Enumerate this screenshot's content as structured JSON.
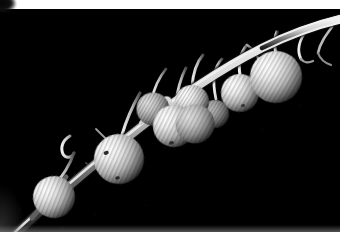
{
  "image": {
    "kind": "photograph",
    "subject": "branch with hanging berries",
    "palette": "monochrome black and white",
    "background_color": "#000000",
    "border_color": "#ffffff",
    "highlight_color": "#f2f2f2",
    "midtone_color": "#9a9a9a",
    "shadow_color": "#1a1a1a",
    "stem_color": "#d8d8d8",
    "width": 348,
    "height": 232,
    "border_top_px": 9,
    "border_right_px": 8,
    "alt_text": "High contrast black and white macro photograph of an arching branch running from the lower left to the upper right of the frame, with nine round, finely ribbed berries hanging from slender curved stalks against a pure black background.",
    "berry_count": 9,
    "stalk_count": 11
  },
  "elements": {
    "branch_label": "main branch",
    "berries_label": "hanging berries",
    "stalks_label": "berry stalks",
    "background_label": "black background",
    "border_label": "white photo border",
    "corner_mark_label": "dark corner mark"
  },
  "berries": [
    {
      "id": "berry-1",
      "cx": 54,
      "cy": 188,
      "rx": 21,
      "ry": 20,
      "rotate": -16,
      "brightness": 0.94
    },
    {
      "id": "berry-2",
      "cx": 119,
      "cy": 150,
      "rx": 25,
      "ry": 25,
      "rotate": -14,
      "brightness": 0.97
    },
    {
      "id": "berry-3",
      "cx": 174,
      "cy": 117,
      "rx": 21,
      "ry": 21,
      "rotate": -12,
      "brightness": 0.9
    },
    {
      "id": "berry-4",
      "cx": 153,
      "cy": 100,
      "rx": 16,
      "ry": 16,
      "rotate": -12,
      "brightness": 0.8
    },
    {
      "id": "berry-5",
      "cx": 192,
      "cy": 93,
      "rx": 16,
      "ry": 16,
      "rotate": -10,
      "brightness": 0.86
    },
    {
      "id": "berry-6",
      "cx": 189,
      "cy": 118,
      "rx": 20,
      "ry": 20,
      "rotate": -10,
      "brightness": 0.88
    },
    {
      "id": "berry-7",
      "cx": 240,
      "cy": 84,
      "rx": 18,
      "ry": 18,
      "rotate": -9,
      "brightness": 0.82
    },
    {
      "id": "berry-8",
      "cx": 276,
      "cy": 68,
      "rx": 26,
      "ry": 26,
      "rotate": -8,
      "brightness": 0.95
    },
    {
      "id": "berry-9",
      "cx": 215,
      "cy": 105,
      "rx": 14,
      "ry": 14,
      "rotate": -10,
      "brightness": 0.7
    }
  ],
  "stalks": [
    {
      "id": "stalk-1",
      "path": "M 48 206 C 46 214 44 222 42 231"
    },
    {
      "id": "stalk-2",
      "path": "M 70 136 C 66 150 60 166 50 172"
    },
    {
      "id": "stalk-3",
      "path": "M 96 122 C 104 132 114 130 119 127"
    },
    {
      "id": "stalk-4",
      "path": "M 126 112 C 120 126 114 136 108 142"
    },
    {
      "id": "stalk-5",
      "path": "M 150 90  C 152 78  154 72  156 66"
    },
    {
      "id": "stalk-6",
      "path": "M 174 96  C 176 84  178 76  180 70"
    },
    {
      "id": "stalk-7",
      "path": "M 192 77  C 194 66  196 60  198 54"
    },
    {
      "id": "stalk-8",
      "path": "M 216 91  C 214 80  212 70  210 62"
    },
    {
      "id": "stalk-9",
      "path": "M 240 66  C 238 56  236 50  234 44"
    },
    {
      "id": "stalk-10",
      "path": "M 276 42  C 276 34  277 28  278 22"
    },
    {
      "id": "stalk-11",
      "path": "M 305 24  C 300 32  297 40  300 48"
    }
  ],
  "branch": {
    "id": "main-branch",
    "path": "M 20 223 C 48 196 88 160 128 127 C 168 94 214 62 258 40 C 288 26 312 18 340 12",
    "width_near": 9,
    "width_far": 4
  }
}
